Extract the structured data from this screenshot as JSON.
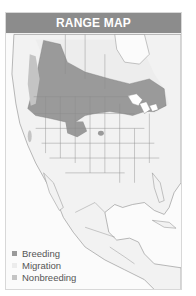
{
  "header": {
    "title": "RANGE MAP"
  },
  "legend": {
    "items": [
      {
        "label": "Breeding",
        "color": "#9a9a9a"
      },
      {
        "label": "Migration",
        "color": "#f2f2f2"
      },
      {
        "label": "Nonbreeding",
        "color": "#c4c4c4"
      }
    ]
  },
  "colors": {
    "header_bg": "#8c8c8c",
    "breeding": "#9a9a9a",
    "migration": "#ececec",
    "nonbreeding": "#c4c4c4",
    "land": "#f4f4f4",
    "borders": "#8a8a8a"
  }
}
